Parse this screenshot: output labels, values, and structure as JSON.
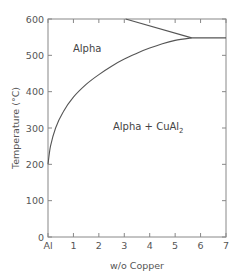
{
  "chart_data": {
    "type": "line",
    "title": "",
    "xlabel": "w/o Copper",
    "ylabel": "Temperature (°C)",
    "xlim": [
      0,
      7
    ],
    "ylim": [
      0,
      600
    ],
    "grid": false,
    "legend": null,
    "x_ticks": [
      {
        "value": 0,
        "label": "Al"
      },
      {
        "value": 1,
        "label": "1"
      },
      {
        "value": 2,
        "label": "2"
      },
      {
        "value": 3,
        "label": "3"
      },
      {
        "value": 4,
        "label": "4"
      },
      {
        "value": 5,
        "label": "5"
      },
      {
        "value": 6,
        "label": "6"
      },
      {
        "value": 7,
        "label": "7"
      }
    ],
    "y_ticks": [
      {
        "value": 0,
        "label": "0"
      },
      {
        "value": 100,
        "label": "100"
      },
      {
        "value": 200,
        "label": "200"
      },
      {
        "value": 300,
        "label": "300"
      },
      {
        "value": 400,
        "label": "400"
      },
      {
        "value": 500,
        "label": "500"
      },
      {
        "value": 600,
        "label": "600"
      }
    ],
    "series": [
      {
        "name": "solvus",
        "points": [
          [
            0,
            200
          ],
          [
            0.1,
            250
          ],
          [
            0.3,
            300
          ],
          [
            0.6,
            345
          ],
          [
            1.0,
            385
          ],
          [
            1.5,
            420
          ],
          [
            2.0,
            447
          ],
          [
            2.5,
            470
          ],
          [
            3.0,
            490
          ],
          [
            3.5,
            506
          ],
          [
            4.0,
            520
          ],
          [
            4.5,
            532
          ],
          [
            5.0,
            541
          ],
          [
            5.65,
            548
          ]
        ]
      },
      {
        "name": "solidus",
        "points": [
          [
            3.05,
            600
          ],
          [
            5.65,
            548
          ]
        ]
      },
      {
        "name": "eutectic",
        "points": [
          [
            5.65,
            548
          ],
          [
            7.0,
            548
          ]
        ]
      }
    ],
    "annotations": [
      {
        "text": "Alpha",
        "x": 1.2,
        "y": 505
      },
      {
        "text": "Alpha + CuAl",
        "subscript": "2",
        "x": 2.55,
        "y": 308
      }
    ]
  },
  "labels": {
    "region_alpha": "Alpha",
    "region_mix": "Alpha + CuAl",
    "region_mix_sub": "2",
    "xlabel": "w/o Copper",
    "ylabel": "Temperature (°C)"
  }
}
